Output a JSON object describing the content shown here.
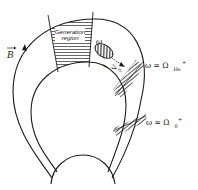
{
  "diagram": {
    "field_label": "B",
    "generation_region": {
      "line1": "Generation",
      "line2": "region"
    },
    "wave": {
      "frequency_label": "ω",
      "group_velocity_label": "V",
      "group_velocity_subscript": "g"
    },
    "resonances": [
      {
        "lhs": "ω = Ω",
        "subscript": "He",
        "superscript": "+"
      },
      {
        "lhs": "ω = Ω",
        "subscript": "0",
        "superscript": "+"
      }
    ],
    "colors": {
      "line": "#1a1a1a",
      "hatch": "#4a4a4a",
      "background": "#ffffff"
    }
  }
}
